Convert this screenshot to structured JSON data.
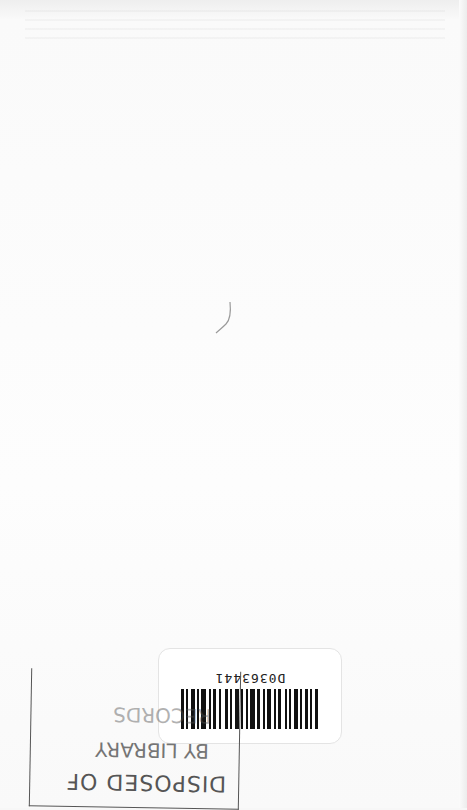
{
  "page": {
    "orientation": "rotated-180",
    "background_color": "#fdfdfd"
  },
  "barcode_label": {
    "number": "D0363441"
  },
  "stamp": {
    "line1": "DISPOSED OF",
    "line2": "BY LIBRARY",
    "line3": "RECORDS",
    "color": "#555555"
  }
}
